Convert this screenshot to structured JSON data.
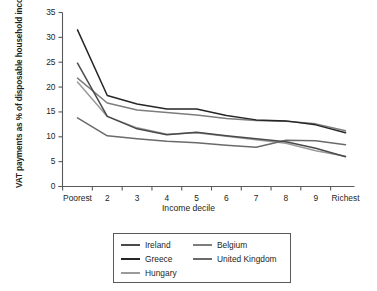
{
  "chart_data": {
    "type": "line",
    "title": "",
    "xlabel": "Income decile",
    "ylabel": "VAT payments as % of disposable household income",
    "x": [
      1,
      2,
      3,
      4,
      5,
      6,
      7,
      8,
      9,
      10
    ],
    "categories": [
      "Poorest",
      "2",
      "3",
      "4",
      "5",
      "6",
      "7",
      "8",
      "9",
      "Richest"
    ],
    "xtick_labels": [
      "Poorest",
      "2",
      "3",
      "4",
      "5",
      "6",
      "7",
      "8",
      "9",
      "Richest"
    ],
    "ytick_labels": [
      "0",
      "5",
      "10",
      "15",
      "20",
      "25",
      "30",
      "35"
    ],
    "ytick_values": [
      0,
      5,
      10,
      15,
      20,
      25,
      30,
      35
    ],
    "ylim": [
      0,
      35
    ],
    "xlim": [
      1,
      10
    ],
    "grid": false,
    "legend_position": "bottom",
    "series": [
      {
        "name": "Ireland",
        "color": "#4a4a4a",
        "values": [
          24.8,
          14.1,
          11.6,
          10.4,
          10.9,
          10.2,
          9.6,
          9.0,
          7.7,
          6.0
        ]
      },
      {
        "name": "Greece",
        "color": "#262626",
        "values": [
          31.5,
          18.3,
          16.6,
          15.6,
          15.6,
          14.3,
          13.4,
          13.2,
          12.4,
          10.8
        ]
      },
      {
        "name": "Hungary",
        "color": "#9a9a9a",
        "values": [
          21.0,
          14.1,
          11.8,
          10.5,
          10.8,
          10.1,
          9.4,
          8.7,
          7.2,
          6.1
        ]
      },
      {
        "name": "Belgium",
        "color": "#7d7d7d",
        "values": [
          21.8,
          16.8,
          15.4,
          14.9,
          14.4,
          13.7,
          13.3,
          13.1,
          12.6,
          11.2
        ]
      },
      {
        "name": "United Kingdom",
        "color": "#6a6a6a",
        "values": [
          13.8,
          10.2,
          9.6,
          9.1,
          8.8,
          8.3,
          7.9,
          9.3,
          9.2,
          8.4
        ]
      }
    ]
  },
  "legend": {
    "items": [
      {
        "label": "Ireland",
        "color": "#4a4a4a"
      },
      {
        "label": "Belgium",
        "color": "#7d7d7d"
      },
      {
        "label": "Greece",
        "color": "#262626"
      },
      {
        "label": "United Kingdom",
        "color": "#6a6a6a"
      },
      {
        "label": "Hungary",
        "color": "#9a9a9a"
      }
    ]
  },
  "axis": {
    "line_color": "#58595b"
  }
}
